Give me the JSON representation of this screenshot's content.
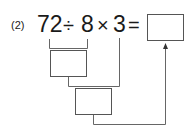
{
  "problem": {
    "label": "(2)",
    "expression": {
      "n1": "72",
      "op1": "÷",
      "n2": "8",
      "op2": "×",
      "n3": "3",
      "eq": "="
    },
    "boxes": {
      "step1_result": "",
      "step2_result": "",
      "final_answer": ""
    }
  },
  "colors": {
    "text": "#1a1a1a",
    "lines": "#555555"
  }
}
